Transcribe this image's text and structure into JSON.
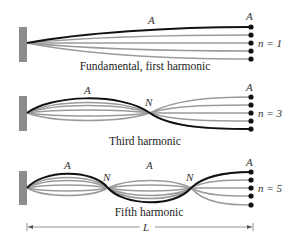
{
  "figure": {
    "panels": [
      {
        "id": "fundamental",
        "caption": "Fundamental, first harmonic",
        "mode_label": "n = 1",
        "n": 1,
        "antinode_labels": [
          "A",
          "A"
        ],
        "node_labels": []
      },
      {
        "id": "third",
        "caption": "Third harmonic",
        "mode_label": "n = 3",
        "n": 3,
        "antinode_labels": [
          "A",
          "A"
        ],
        "node_labels": [
          "N"
        ]
      },
      {
        "id": "fifth",
        "caption": "Fifth harmonic",
        "mode_label": "n = 5",
        "n": 5,
        "antinode_labels": [
          "A",
          "A",
          "A"
        ],
        "node_labels": [
          "N",
          "N"
        ]
      }
    ],
    "dimension": {
      "label": "L"
    },
    "colors": {
      "wall": "#8c8c8c",
      "envelope": "#111111",
      "intermediate": "#9a9a9a",
      "dots": "#111111"
    }
  }
}
